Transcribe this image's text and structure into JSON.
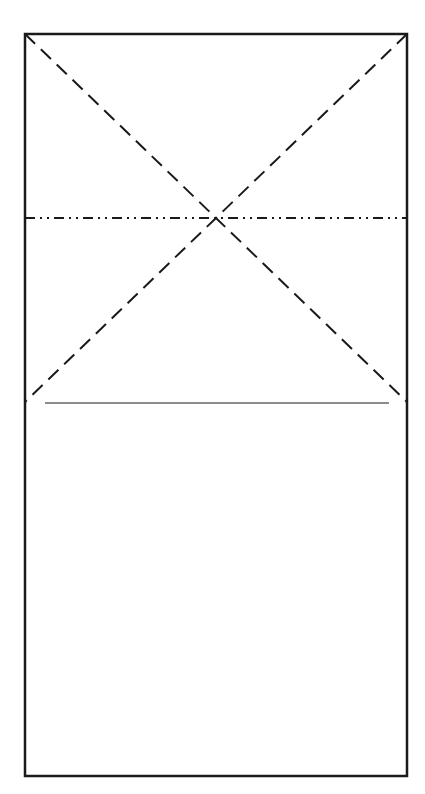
{
  "diagram": {
    "type": "origami-fold-diagram",
    "canvas": {
      "width": 425,
      "height": 794,
      "background": "#ffffff"
    },
    "stroke_color": "#1a1a1a",
    "paper": {
      "x1": 25,
      "y1": 34,
      "x2": 407,
      "y2": 776,
      "stroke_width": 2.5
    },
    "valley_folds": [
      {
        "name": "diagonal-top-left-to-right",
        "x1": 25,
        "y1": 34,
        "x2": 407,
        "y2": 402,
        "dash": "14 8",
        "stroke_width": 2
      },
      {
        "name": "diagonal-top-right-to-left",
        "x1": 407,
        "y1": 34,
        "x2": 25,
        "y2": 402,
        "dash": "14 8",
        "stroke_width": 2
      }
    ],
    "mountain_fold": {
      "x1": 25,
      "y1": 218,
      "x2": 407,
      "y2": 218,
      "dash": "10 5 2 5 2 5",
      "stroke_width": 2
    },
    "reference_line": {
      "x1": 45,
      "y1": 403,
      "x2": 389,
      "y2": 403,
      "stroke_width": 1
    }
  }
}
